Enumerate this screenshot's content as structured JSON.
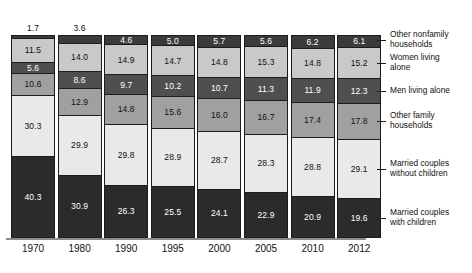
{
  "chart_data": {
    "type": "bar",
    "subtype": "stacked-bar-100",
    "title": "",
    "xlabel": "",
    "ylabel": "",
    "ylim": [
      0,
      100
    ],
    "grid": false,
    "legend_position": "right",
    "stack_order": "top-to-bottom",
    "categories": [
      "1970",
      "1980",
      "1990",
      "1995",
      "2000",
      "2005",
      "2010",
      "2012"
    ],
    "series": [
      {
        "name": "Other nonfamily households",
        "legend_label_line1": "Other nonfamily",
        "legend_label_line2": "households",
        "color": "#3b3b3b",
        "values": [
          1.7,
          3.6,
          4.6,
          5.0,
          5.7,
          5.6,
          6.2,
          6.1
        ],
        "labels": [
          "1.7",
          "3.6",
          "4.6",
          "5.0",
          "5.7",
          "5.6",
          "6.2",
          "6.1"
        ]
      },
      {
        "name": "Women living alone",
        "legend_label_line1": "Women living",
        "legend_label_line2": "alone",
        "color": "#c9c9c9",
        "values": [
          11.5,
          14.0,
          14.9,
          14.7,
          14.8,
          15.3,
          14.8,
          15.2
        ],
        "labels": [
          "11.5",
          "14.0",
          "14.9",
          "14.7",
          "14.8",
          "15.3",
          "14.8",
          "15.2"
        ]
      },
      {
        "name": "Men living alone",
        "legend_label_line1": "Men living alone",
        "legend_label_line2": "",
        "color": "#4f4f4f",
        "values": [
          5.6,
          8.6,
          9.7,
          10.2,
          10.7,
          11.3,
          11.9,
          12.3
        ],
        "labels": [
          "5.6",
          "8.6",
          "9.7",
          "10.2",
          "10.7",
          "11.3",
          "11.9",
          "12.3"
        ]
      },
      {
        "name": "Other family households",
        "legend_label_line1": "Other family",
        "legend_label_line2": "households",
        "color": "#a0a0a0",
        "values": [
          10.6,
          12.9,
          14.8,
          15.6,
          16.0,
          16.7,
          17.4,
          17.8
        ],
        "labels": [
          "10.6",
          "12.9",
          "14.8",
          "15.6",
          "16.0",
          "16.7",
          "17.4",
          "17.8"
        ]
      },
      {
        "name": "Married couples without children",
        "legend_label_line1": "Married couples",
        "legend_label_line2": "without children",
        "color": "#e9e9e9",
        "values": [
          30.3,
          29.9,
          29.8,
          28.9,
          28.7,
          28.3,
          28.8,
          29.1
        ],
        "labels": [
          "30.3",
          "29.9",
          "29.8",
          "28.9",
          "28.7",
          "28.3",
          "28.8",
          "29.1"
        ]
      },
      {
        "name": "Married couples with children",
        "legend_label_line1": "Married couples",
        "legend_label_line2": "with children",
        "color": "#2b2b2b",
        "values": [
          40.3,
          30.9,
          26.3,
          25.5,
          24.1,
          22.9,
          20.9,
          19.6
        ],
        "labels": [
          "40.3",
          "30.9",
          "26.3",
          "25.5",
          "24.1",
          "22.9",
          "20.9",
          "19.6"
        ]
      }
    ]
  }
}
